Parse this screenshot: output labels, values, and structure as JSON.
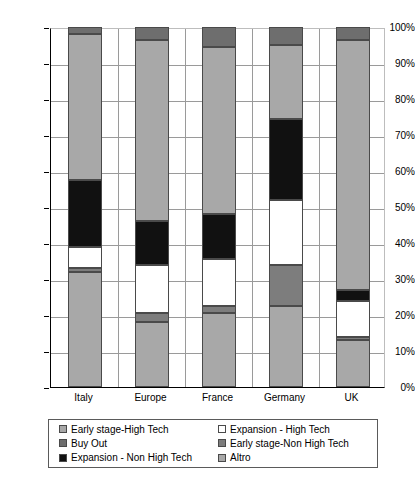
{
  "chart_data": {
    "type": "bar",
    "subtype": "stacked-100-percent",
    "title": "",
    "xlabel": "",
    "ylabel": "",
    "ylim": [
      0,
      100
    ],
    "ytick_labels": [
      "100%",
      "90%",
      "80%",
      "70%",
      "60%",
      "50%",
      "40%",
      "30%",
      "20%",
      "10%",
      "0%"
    ],
    "ytick_values": [
      100,
      90,
      80,
      70,
      60,
      50,
      40,
      30,
      20,
      10,
      0
    ],
    "grid": true,
    "legend_position": "bottom",
    "categories": [
      "Italy",
      "Europe",
      "France",
      "Germany",
      "UK"
    ],
    "series": [
      {
        "name": "Early stage-High Tech",
        "color": "#a8a8a8",
        "values": [
          32.0,
          18.0,
          20.5,
          22.5,
          13.0
        ]
      },
      {
        "name": "Early stage-Non High Tech",
        "color": "#7d7d7d",
        "values": [
          1.0,
          2.5,
          2.0,
          11.5,
          1.0
        ]
      },
      {
        "name": "Expansion - High Tech",
        "color": "#ffffff",
        "values": [
          6.0,
          13.5,
          13.0,
          18.0,
          10.0
        ]
      },
      {
        "name": "Expansion - Non High Tech",
        "color": "#111111",
        "values": [
          18.5,
          12.0,
          12.5,
          22.5,
          3.0
        ]
      },
      {
        "name": "Buy Out",
        "color": "#6e6e6e",
        "values": [
          2.0,
          3.5,
          5.5,
          5.0,
          3.5
        ]
      },
      {
        "name": "Altro",
        "color": "#a8a8a8",
        "values": [
          40.5,
          50.5,
          46.5,
          20.5,
          69.5
        ]
      }
    ],
    "stack_order_bottom_to_top": [
      "Early stage-High Tech",
      "Early stage-Non High Tech",
      "Expansion - High Tech",
      "Expansion - Non High Tech",
      "Altro",
      "Buy Out"
    ]
  },
  "legend": {
    "entries": [
      {
        "label": "Early stage-High Tech",
        "color": "#a8a8a8"
      },
      {
        "label": "Early stage-Non High Tech",
        "color": "#7d7d7d"
      },
      {
        "label": "Expansion - High Tech",
        "color": "#ffffff"
      },
      {
        "label": "Expansion - Non High Tech",
        "color": "#111111"
      },
      {
        "label": "Buy Out",
        "color": "#6e6e6e"
      },
      {
        "label": "Altro",
        "color": "#a8a8a8"
      }
    ]
  }
}
